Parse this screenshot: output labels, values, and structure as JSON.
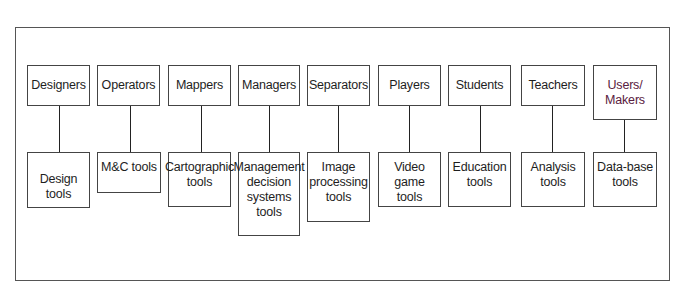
{
  "diagram": {
    "type": "role-to-tool mapping",
    "pairs": [
      {
        "role": "Designers",
        "tool": "Design\ntools"
      },
      {
        "role": "Operators",
        "tool": "M&C tools"
      },
      {
        "role": "Mappers",
        "tool": "Cartographic\ntools"
      },
      {
        "role": "Managers",
        "tool": "Management\ndecision\nsystems\ntools"
      },
      {
        "role": "Separators",
        "tool": "Image\nprocessing\ntools"
      },
      {
        "role": "Players",
        "tool": "Video game\ntools"
      },
      {
        "role": "Students",
        "tool": "Education\ntools"
      },
      {
        "role": "Teachers",
        "tool": "Analysis\ntools"
      },
      {
        "role": "Users/\nMakers",
        "tool": "Data-base\ntools"
      }
    ],
    "colors": {
      "border": "#444444",
      "frame": "#555555",
      "connector": "#222222",
      "text": "#1e1e1e",
      "makers_text": "#5a2040"
    }
  }
}
